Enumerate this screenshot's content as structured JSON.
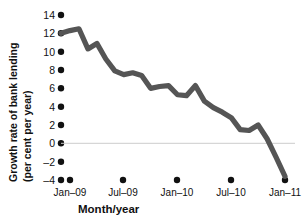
{
  "chart_data": {
    "type": "line",
    "title": "",
    "subtitle": "",
    "xlabel": "Month/year",
    "ylabel": "Growth rate of bank lending (per cent per year)",
    "ylabel_line1": "Growth rate of bank lending",
    "ylabel_line2": "(per cent per year)",
    "ylim": [
      -4,
      14
    ],
    "yticks": [
      14,
      12,
      10,
      8,
      6,
      4,
      2,
      0,
      -2,
      -4
    ],
    "ytick_labels": [
      "14",
      "12",
      "10",
      "8",
      "6",
      "4",
      "2",
      "0",
      "–2",
      "–4"
    ],
    "xticks": [
      "Jan–09",
      "Jul–09",
      "Jan–10",
      "Jul–10",
      "Jan–11"
    ],
    "xtick_months": [
      0,
      6,
      12,
      18,
      24
    ],
    "grid": false,
    "zero_line": true,
    "legend": "none",
    "line_color": "#555555",
    "axis_color": "#111111",
    "zero_line_color": "#cccccc",
    "background": "#ffffff",
    "series": [
      {
        "name": "Growth rate of bank lending",
        "x": [
          "Dec–08",
          "Jan–09",
          "Feb–09",
          "Mar–09",
          "Apr–09",
          "May–09",
          "Jun–09",
          "Jul–09",
          "Aug–09",
          "Sep–09",
          "Oct–09",
          "Nov–09",
          "Dec–09",
          "Jan–10",
          "Feb–10",
          "Mar–10",
          "Apr–10",
          "May–10",
          "Jun–10",
          "Jul–10",
          "Aug–10",
          "Sep–10",
          "Oct–10",
          "Nov–10",
          "Dec–10",
          "Jan–11"
        ],
        "month_index": [
          -1,
          0,
          1,
          2,
          3,
          4,
          5,
          6,
          7,
          8,
          9,
          10,
          11,
          12,
          13,
          14,
          15,
          16,
          17,
          18,
          19,
          20,
          21,
          22,
          23,
          24
        ],
        "values": [
          12.0,
          12.3,
          12.5,
          10.3,
          10.9,
          9.2,
          7.9,
          7.5,
          7.7,
          7.4,
          6.0,
          6.2,
          6.3,
          5.3,
          5.2,
          6.3,
          4.6,
          3.9,
          3.4,
          2.8,
          1.5,
          1.4,
          2.0,
          0.5,
          -1.5,
          -3.6
        ]
      }
    ]
  },
  "figure": {
    "plot_area": {
      "left": 68,
      "right": 288,
      "top": 15,
      "bottom": 180
    }
  }
}
